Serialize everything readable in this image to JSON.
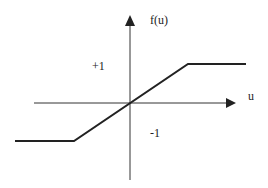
{
  "diagram": {
    "y_axis_label": "f(u)",
    "x_axis_label": "u",
    "upper_level_label": "+1",
    "lower_level_label": "-1",
    "colors": {
      "axis": "#333333",
      "curve": "#222222",
      "text": "#222222"
    }
  }
}
